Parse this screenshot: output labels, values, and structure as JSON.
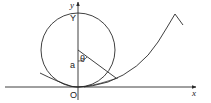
{
  "diagram": {
    "type": "geometry",
    "colors": {
      "stroke": "#2a2a2a",
      "background": "#ffffff"
    },
    "labels": {
      "y_axis": "y",
      "x_axis": "x",
      "top_point": "Y",
      "radius": "a",
      "origin": "O",
      "angle": "θ"
    },
    "elements": {
      "axes": {
        "x_axis_y": 87,
        "y_axis_x": 78
      },
      "circle": {
        "cx": 78,
        "cy": 50,
        "r": 37
      },
      "radius_line": {
        "from": [
          78,
          50
        ],
        "to": [
          116,
          78
        ]
      },
      "curve": "rising curve tangent to x-axis at O, extending up and right to a cusp"
    }
  }
}
